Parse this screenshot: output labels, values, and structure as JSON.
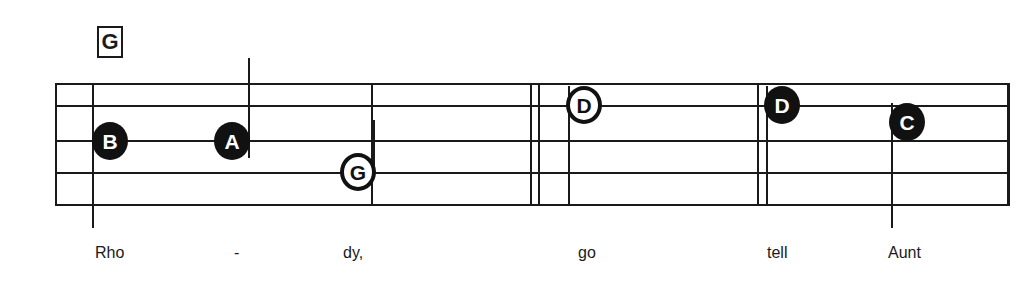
{
  "sheet": {
    "chord": {
      "label": "G"
    },
    "staff": {
      "line_count": 5,
      "left_barline_label": "start-barline",
      "end_barline_label": "final-barline"
    },
    "notes": [
      {
        "letter": "B",
        "style": "filled",
        "stem": "down"
      },
      {
        "letter": "A",
        "style": "filled",
        "stem": "up"
      },
      {
        "letter": "G",
        "style": "hollow",
        "stem": "up"
      },
      {
        "letter": "D",
        "style": "hollow",
        "stem": "down"
      },
      {
        "letter": "D",
        "style": "filled",
        "stem": "down"
      },
      {
        "letter": "C",
        "style": "filled",
        "stem": "down"
      }
    ],
    "lyrics": [
      {
        "text": "Rho"
      },
      {
        "text": "-"
      },
      {
        "text": "dy,"
      },
      {
        "text": "go"
      },
      {
        "text": "tell"
      },
      {
        "text": "Aunt"
      }
    ],
    "colors": {
      "ink": "#1a1a1a",
      "notehead_fill": "#111111",
      "notehead_text_light": "#ffffff",
      "paper": "#ffffff"
    }
  }
}
